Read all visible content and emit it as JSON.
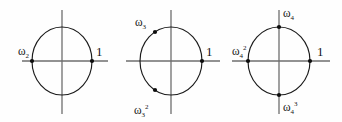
{
  "figure": {
    "background_color": "#fefefe",
    "axis_color": "#6e6e6e",
    "circle_color": "#1a1a1a",
    "dot_color": "#0d0d0d",
    "text_color": "#151515"
  },
  "diagrams": [
    {
      "id": "diagram-n2",
      "name": "second-roots-of-unity",
      "center": {
        "x": 62,
        "y": 61
      },
      "radius_x": 30,
      "radius_y": 34,
      "axis": {
        "horizontal": {
          "x1": 22,
          "x2": 108,
          "y": 61
        },
        "vertical": {
          "x": 62,
          "y1": 10,
          "y2": 114
        }
      },
      "points": [
        {
          "name": "root-omega-2",
          "angle_deg": 180,
          "label_base": "ω",
          "label_sub": "2",
          "label_sup": "",
          "label_x": 18,
          "label_y": 55,
          "dot_x": 32,
          "dot_y": 61
        },
        {
          "name": "root-one",
          "angle_deg": 0,
          "label_base": "1",
          "label_sub": "",
          "label_sup": "",
          "label_x": 96,
          "label_y": 56,
          "dot_x": 92,
          "dot_y": 61
        }
      ]
    },
    {
      "id": "diagram-n3",
      "name": "third-roots-of-unity",
      "center": {
        "x": 171,
        "y": 61
      },
      "radius_x": 31,
      "radius_y": 34,
      "axis": {
        "horizontal": {
          "x1": 126,
          "x2": 220,
          "y": 61
        },
        "vertical": {
          "x": 171,
          "y1": 10,
          "y2": 114
        }
      },
      "points": [
        {
          "name": "root-omega-3",
          "angle_deg": 120,
          "label_base": "ω",
          "label_sub": "3",
          "label_sup": "",
          "label_x": 135,
          "label_y": 26,
          "dot_x": 155,
          "dot_y": 32
        },
        {
          "name": "root-omega-3-squared",
          "angle_deg": 240,
          "label_base": "ω",
          "label_sub": "3",
          "label_sup": "2",
          "label_x": 134,
          "label_y": 114,
          "dot_x": 155,
          "dot_y": 90
        },
        {
          "name": "root-one",
          "angle_deg": 0,
          "label_base": "1",
          "label_sub": "",
          "label_sup": "",
          "label_x": 206,
          "label_y": 56,
          "dot_x": 202,
          "dot_y": 61
        }
      ]
    },
    {
      "id": "diagram-n4",
      "name": "fourth-roots-of-unity",
      "center": {
        "x": 279,
        "y": 61
      },
      "radius_x": 31,
      "radius_y": 34,
      "axis": {
        "horizontal": {
          "x1": 232,
          "x2": 330,
          "y": 61
        },
        "vertical": {
          "x": 279,
          "y1": 10,
          "y2": 114
        }
      },
      "points": [
        {
          "name": "root-omega-4",
          "angle_deg": 90,
          "label_base": "ω",
          "label_sub": "4",
          "label_sup": "",
          "label_x": 283,
          "label_y": 17,
          "dot_x": 279,
          "dot_y": 27
        },
        {
          "name": "root-omega-4-squared",
          "angle_deg": 180,
          "label_base": "ω",
          "label_sub": "4",
          "label_sup": "2",
          "label_x": 232,
          "label_y": 55,
          "dot_x": 248,
          "dot_y": 61
        },
        {
          "name": "root-omega-4-cubed",
          "angle_deg": 270,
          "label_base": "ω",
          "label_sub": "4",
          "label_sup": "3",
          "label_x": 283,
          "label_y": 111,
          "dot_x": 279,
          "dot_y": 95
        },
        {
          "name": "root-one",
          "angle_deg": 0,
          "label_base": "1",
          "label_sub": "",
          "label_sup": "",
          "label_x": 317,
          "label_y": 56,
          "dot_x": 310,
          "dot_y": 61
        }
      ]
    }
  ]
}
